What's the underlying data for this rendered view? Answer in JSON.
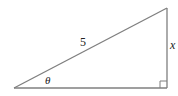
{
  "diagram": {
    "type": "right-triangle",
    "stroke_color": "#7f7f7f",
    "vertices": {
      "angle_vertex": [
        14,
        88
      ],
      "right_angle_vertex": [
        167,
        88
      ],
      "top_vertex": [
        167,
        8
      ]
    },
    "labels": {
      "hypotenuse": "5",
      "opposite_side": "x",
      "angle": "θ"
    },
    "right_angle_marker": true
  }
}
